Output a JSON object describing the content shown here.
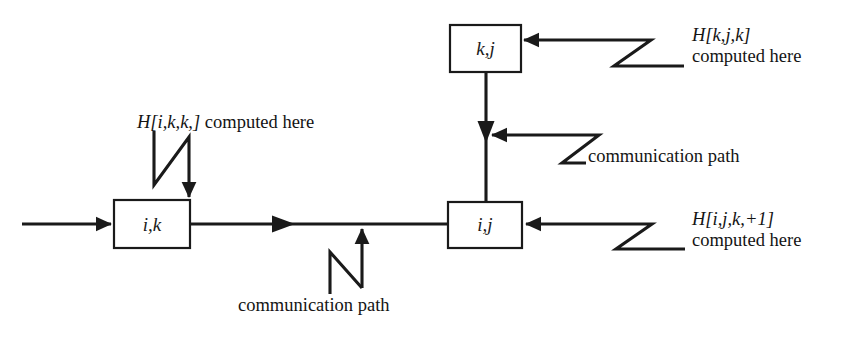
{
  "diagram": {
    "background_color": "#ffffff",
    "stroke_color": "#1a1a1a",
    "nodes": [
      {
        "id": "ik",
        "label": "i,k",
        "x": 114,
        "y": 200,
        "w": 76,
        "h": 48
      },
      {
        "id": "kj",
        "label": "k,j",
        "x": 450,
        "y": 25,
        "w": 71,
        "h": 47
      },
      {
        "id": "ij",
        "label": "i,j",
        "x": 448,
        "y": 202,
        "w": 74,
        "h": 46
      }
    ],
    "annotations": [
      {
        "id": "annot-ikk",
        "line1_math": "H[i,k,k,]",
        "line1_tail": " computed here",
        "line2": ""
      },
      {
        "id": "annot-kjk",
        "line1_math": "H[k,j,k]",
        "line1_tail": "",
        "line2": "computed here"
      },
      {
        "id": "annot-ijk1",
        "line1_math": "H[i,j,k,+1]",
        "line1_tail": "",
        "line2": "computed here"
      },
      {
        "id": "annot-comm-right",
        "line1_math": "",
        "line1_tail": "communication path",
        "line2": ""
      },
      {
        "id": "annot-comm-bottom",
        "line1_math": "",
        "line1_tail": "communication path",
        "line2": ""
      }
    ]
  },
  "labels": {
    "node_ik": "i,k",
    "node_kj": "k,j",
    "node_ij": "i,j",
    "h_ikk": "H[i,k,k,]",
    "h_ikk_tail": " computed here",
    "h_kjk": "H[k,j,k]",
    "h_kjk_line2": "computed here",
    "h_ijk1": "H[i,j,k,+1]",
    "h_ijk1_line2": "computed here",
    "communication_path_right": "communication path",
    "communication_path_bottom": "communication path"
  }
}
